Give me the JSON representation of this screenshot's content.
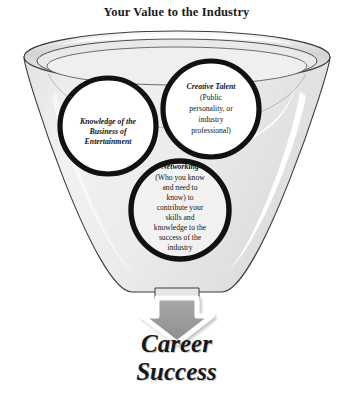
{
  "title": "Your Value to the Industry",
  "colors": {
    "funnel_fill": "#ededed",
    "funnel_rim": "#d7d7d7",
    "funnel_outline": "#3a3a3a",
    "circle_stroke": "#111111",
    "circle_fill": "#ffffff",
    "arrow_fill": "#9a9a9a",
    "arrow_outline": "#ffffff",
    "text": "#1a1a1a",
    "background": "#ffffff"
  },
  "funnel": {
    "name": "funnel-container",
    "label": "Funnel"
  },
  "circles": [
    {
      "id": "knowledge",
      "heading": "Knowledge of the",
      "lines": [
        "Business of",
        "Entertainment"
      ],
      "heading_style": "bold-italic",
      "cx": 108,
      "cy": 126,
      "r": 48
    },
    {
      "id": "creative-talent",
      "heading": "Creative Talent",
      "lines": [
        "(Public",
        "personality, or",
        "industry",
        "professional)"
      ],
      "heading_style": "bold-italic",
      "cx": 211,
      "cy": 109,
      "r": 48
    },
    {
      "id": "networking",
      "heading": "Networking",
      "lines": [
        "(Who you know",
        "and need to",
        "know) to",
        "contribute your",
        "skills and",
        "knowledge to the",
        "success of the",
        "industry"
      ],
      "heading_style": "bold-italic",
      "cx": 180,
      "cy": 210,
      "r": 49
    }
  ],
  "arrow": {
    "name": "down-arrow",
    "label": "Down arrow"
  },
  "outcome": {
    "line1": "Career",
    "line2": "Success"
  }
}
